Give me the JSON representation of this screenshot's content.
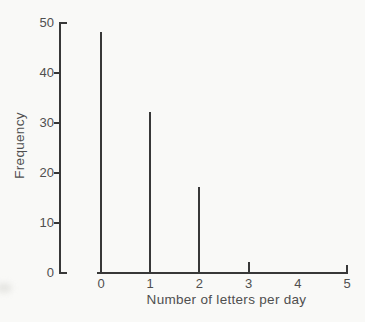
{
  "chart_data": {
    "type": "bar",
    "style": "vertical-line-spike-graph",
    "title": "",
    "xlabel": "Number of letters per day",
    "ylabel": "Frequency",
    "categories": [
      "0",
      "1",
      "2",
      "3",
      "4",
      "5"
    ],
    "values": [
      48,
      32,
      17,
      2,
      0,
      1
    ],
    "yticks": [
      0,
      10,
      20,
      30,
      40,
      50
    ],
    "ylim": [
      0,
      50
    ],
    "xlim": [
      0,
      5
    ],
    "grid": false,
    "legend": "none",
    "line_color": "#383838",
    "text_color": "#4f4f4f",
    "background_color": "#f9f9f7"
  }
}
